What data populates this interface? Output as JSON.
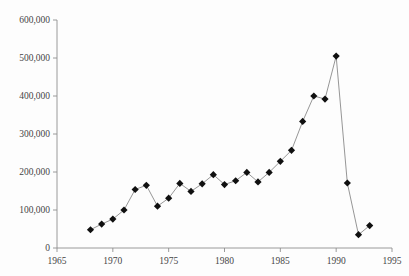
{
  "chart_data": {
    "type": "line",
    "title": "",
    "xlabel": "",
    "ylabel": "",
    "xlim": [
      1965,
      1995
    ],
    "ylim": [
      0,
      600000
    ],
    "xticks": [
      1965,
      1970,
      1975,
      1980,
      1985,
      1990,
      1995
    ],
    "yticks": [
      0,
      100000,
      200000,
      300000,
      400000,
      500000,
      600000
    ],
    "ytick_labels": [
      "0",
      "100,000",
      "200,000",
      "300,000",
      "400,000",
      "500,000",
      "600,000"
    ],
    "xtick_labels": [
      "1965",
      "1970",
      "1975",
      "1980",
      "1985",
      "1990",
      "1995"
    ],
    "grid": false,
    "legend": false,
    "marker": "diamond",
    "marker_color": "#101010",
    "line_color": "#8a8a8a",
    "axis_color": "#8e8e8e",
    "background_color": "#fdfdfd",
    "x": [
      1968,
      1969,
      1970,
      1971,
      1972,
      1973,
      1974,
      1975,
      1976,
      1977,
      1978,
      1979,
      1980,
      1981,
      1982,
      1983,
      1984,
      1985,
      1986,
      1987,
      1988,
      1989,
      1990,
      1991,
      1992,
      1993
    ],
    "values": [
      48000,
      63000,
      76000,
      100000,
      154000,
      165000,
      110000,
      131000,
      170000,
      149000,
      169000,
      193000,
      167000,
      177000,
      199000,
      174000,
      199000,
      228000,
      257000,
      333000,
      400000,
      392000,
      505000,
      171000,
      35000,
      59000
    ],
    "series": [
      {
        "name": "series-1",
        "x": [
          1968,
          1969,
          1970,
          1971,
          1972,
          1973,
          1974,
          1975,
          1976,
          1977,
          1978,
          1979,
          1980,
          1981,
          1982,
          1983,
          1984,
          1985,
          1986,
          1987,
          1988,
          1989,
          1990,
          1991,
          1992,
          1993
        ],
        "values": [
          48000,
          63000,
          76000,
          100000,
          154000,
          165000,
          110000,
          131000,
          170000,
          149000,
          169000,
          193000,
          167000,
          177000,
          199000,
          174000,
          199000,
          228000,
          257000,
          333000,
          400000,
          392000,
          505000,
          171000,
          35000,
          59000
        ]
      }
    ]
  }
}
